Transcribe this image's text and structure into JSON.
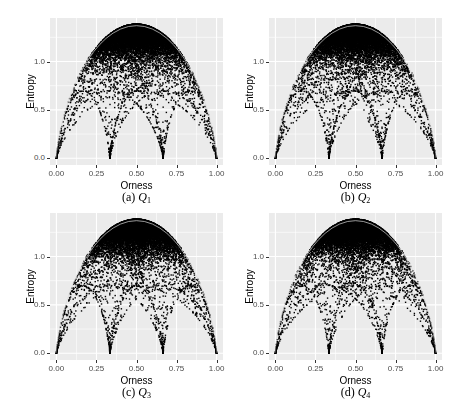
{
  "figure": {
    "panels": [
      {
        "id": "a",
        "caption_prefix": "(a)",
        "caption_symbol": "Q",
        "caption_sub": "1",
        "origin": [
          0,
          0
        ],
        "seed": 11
      },
      {
        "id": "b",
        "caption_prefix": "(b)",
        "caption_symbol": "Q",
        "caption_sub": "2",
        "origin": [
          219,
          0
        ],
        "seed": 23
      },
      {
        "id": "c",
        "caption_prefix": "(c)",
        "caption_symbol": "Q",
        "caption_sub": "3",
        "origin": [
          0,
          195
        ],
        "seed": 37
      },
      {
        "id": "d",
        "caption_prefix": "(d)",
        "caption_symbol": "Q",
        "caption_sub": "4",
        "origin": [
          219,
          195
        ],
        "seed": 53
      }
    ],
    "xlabel": "Orness",
    "ylabel": "Entropy",
    "xticks": [
      "0.00",
      "0.25",
      "0.50",
      "0.75",
      "1.00"
    ],
    "yticks": [
      "0.0",
      "0.5",
      "1.0"
    ],
    "colors": {
      "panel_bg": "#ebebeb",
      "grid": "#ffffff",
      "point": "#000000",
      "tick_text": "#4d4d4d"
    }
  },
  "chart_data": [
    {
      "type": "scatter",
      "title": "(a) Q1",
      "xlabel": "Orness",
      "ylabel": "Entropy",
      "xlim": [
        -0.04,
        1.04
      ],
      "ylim": [
        -0.07,
        1.45
      ],
      "xticks": [
        0,
        0.25,
        0.5,
        0.75,
        1.0
      ],
      "yticks": [
        0,
        0.5,
        1.0
      ],
      "grid": true,
      "legend": null,
      "description": "Dense cloud of OWA weight vectors (n=4); upper envelope is max-entropy arc peaking at ln(4)≈1.386 at orness 0.5; lower envelope has cusps near (0.02,0.15),(0.33,0.28),(0.67,0.15),(0.99,0.13)",
      "upper_envelope": {
        "x": [
          0.05,
          0.1,
          0.2,
          0.3,
          0.4,
          0.5,
          0.6,
          0.7,
          0.8,
          0.9,
          0.95
        ],
        "y": [
          0.45,
          0.62,
          0.92,
          1.15,
          1.32,
          1.386,
          1.32,
          1.15,
          0.92,
          0.62,
          0.45
        ]
      },
      "lower_envelope": {
        "x": [
          0.02,
          0.1,
          0.2,
          0.33,
          0.42,
          0.5,
          0.58,
          0.67,
          0.75,
          0.85,
          0.99
        ],
        "y": [
          0.15,
          0.45,
          0.65,
          0.28,
          0.62,
          0.69,
          0.6,
          0.15,
          0.6,
          0.65,
          0.13
        ]
      }
    },
    {
      "type": "scatter",
      "title": "(b) Q2",
      "xlabel": "Orness",
      "ylabel": "Entropy",
      "xlim": [
        -0.04,
        1.04
      ],
      "ylim": [
        -0.07,
        1.45
      ],
      "grid": true,
      "same_shape_as": "(a) Q1"
    },
    {
      "type": "scatter",
      "title": "(c) Q3",
      "xlabel": "Orness",
      "ylabel": "Entropy",
      "xlim": [
        -0.04,
        1.04
      ],
      "ylim": [
        -0.07,
        1.45
      ],
      "grid": true,
      "same_shape_as": "(a) Q1"
    },
    {
      "type": "scatter",
      "title": "(d) Q4",
      "xlabel": "Orness",
      "ylabel": "Entropy",
      "xlim": [
        -0.04,
        1.04
      ],
      "ylim": [
        -0.07,
        1.45
      ],
      "grid": true,
      "same_shape_as": "(a) Q1"
    }
  ]
}
